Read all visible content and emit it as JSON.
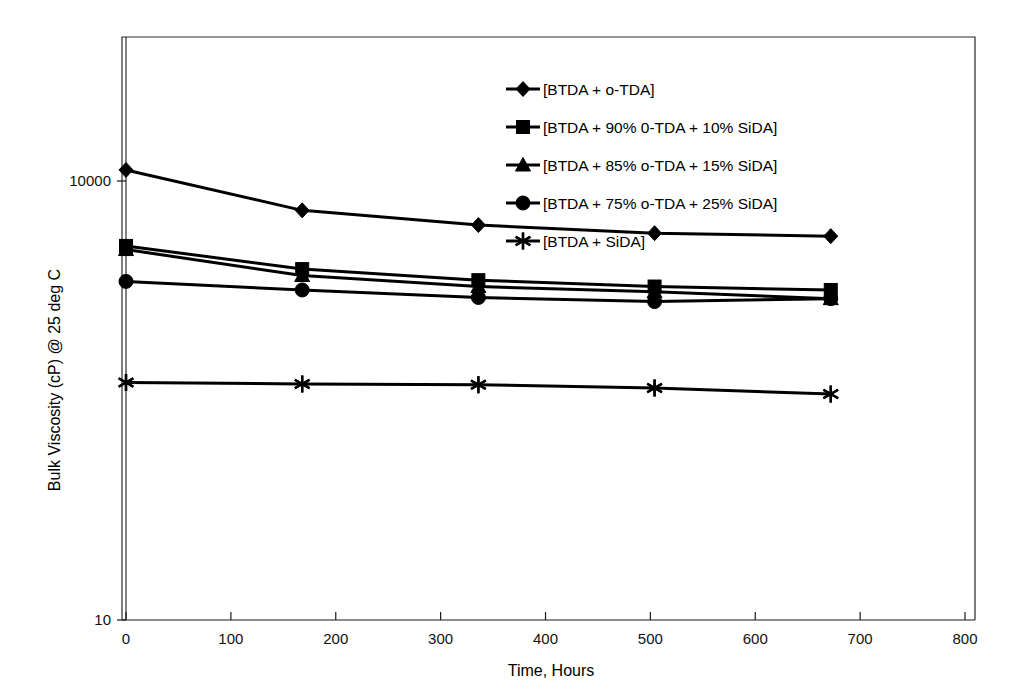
{
  "chart_data": {
    "type": "line",
    "title": "",
    "xlabel": "Time, Hours",
    "ylabel": "Bulk Viscosity (cP) @ 25 deg C",
    "x": [
      0,
      168,
      336,
      504,
      672
    ],
    "xlim": [
      0,
      800
    ],
    "ylim": [
      10,
      30000
    ],
    "yscale": "log",
    "grid": false,
    "legend_position": "upper-center",
    "xticks": [
      "0",
      "100",
      "200",
      "300",
      "400",
      "500",
      "600",
      "700",
      "800"
    ],
    "xtick_values": [
      0,
      100,
      200,
      300,
      400,
      500,
      600,
      700,
      800
    ],
    "yticks": [
      "10",
      "10000"
    ],
    "ytick_values": [
      10,
      10000
    ],
    "series": [
      {
        "name": "[BTDA + o-TDA]",
        "marker": "diamond",
        "values": [
          11900,
          6300,
          5000,
          4400,
          4200
        ]
      },
      {
        "name": "[BTDA + 90% 0-TDA + 10% SiDA]",
        "marker": "square",
        "values": [
          3600,
          2500,
          2100,
          1900,
          1800
        ]
      },
      {
        "name": "[BTDA + 85% o-TDA + 15% SiDA]",
        "marker": "triangle",
        "values": [
          3400,
          2260,
          1900,
          1750,
          1570
        ]
      },
      {
        "name": "[BTDA + 75% o-TDA + 25% SiDA]",
        "marker": "circle",
        "values": [
          2060,
          1800,
          1600,
          1500,
          1570
        ]
      },
      {
        "name": "[BTDA + SiDA]",
        "marker": "asterisk",
        "values": [
          420,
          410,
          405,
          385,
          350
        ]
      }
    ]
  },
  "colors": {
    "ink": "#000000",
    "axis": "#1a1a1a",
    "background": "#ffffff"
  }
}
